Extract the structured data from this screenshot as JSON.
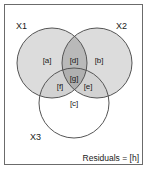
{
  "figure": {
    "type": "venn-diagram-variance-partitioning",
    "background_color": "#ffffff",
    "frame_color": "#6b6b6b"
  },
  "sets": [
    {
      "id": "X1",
      "label": "X1",
      "label_x": 16,
      "label_y": 27,
      "cx": 52,
      "cy": 63,
      "r": 35,
      "fill": "#dcdcdc",
      "stroke": "#555555"
    },
    {
      "id": "X2",
      "label": "X2",
      "label_x": 118,
      "label_y": 27,
      "cx": 97,
      "cy": 63,
      "r": 35,
      "fill": "#dcdcdc",
      "stroke": "#555555"
    },
    {
      "id": "X3",
      "label": "X3",
      "label_x": 35,
      "label_y": 139,
      "cx": 74,
      "cy": 103,
      "r": 35,
      "fill": "#ffffff",
      "stroke": "#555555"
    }
  ],
  "regions": [
    {
      "id": "a",
      "label": "[a]",
      "x": 47,
      "y": 61,
      "meaning": "X1 only"
    },
    {
      "id": "d",
      "label": "[d]",
      "x": 74,
      "y": 61,
      "meaning": "X1 and X2 shared"
    },
    {
      "id": "b",
      "label": "[b]",
      "x": 99,
      "y": 61,
      "meaning": "X2 only"
    },
    {
      "id": "f",
      "label": "[f]",
      "x": 60,
      "y": 87,
      "meaning": "X1 and X3 shared"
    },
    {
      "id": "g",
      "label": "[g]",
      "x": 74,
      "y": 79,
      "meaning": "X1, X2 and X3 shared"
    },
    {
      "id": "e",
      "label": "[e]",
      "x": 88,
      "y": 87,
      "meaning": "X2 and X3 shared"
    },
    {
      "id": "c",
      "label": "[c]",
      "x": 74,
      "y": 104,
      "meaning": "X3 only"
    }
  ],
  "residuals": {
    "text": "Residuals = [h]",
    "id": "h"
  },
  "colors": {
    "circle_fill_light": "#dcdcdc",
    "overlap_two_way": "#c4c4c4",
    "overlap_dark": "#b0b0b0",
    "circle_stroke": "#555555",
    "frame_stroke": "#6b6b6b",
    "text": "#1a1a1a",
    "white": "#ffffff"
  }
}
